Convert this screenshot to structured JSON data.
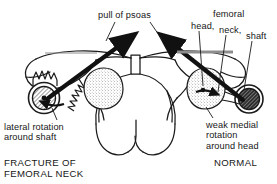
{
  "figure": {
    "background_color": "#ffffff",
    "ink_color": "#161616"
  },
  "annotations": {
    "psoas": "pull of psoas",
    "femoral": "femoral",
    "head": "head,",
    "neck": "neck,",
    "shaft": "shaft",
    "lateral_rotation": "lateral rotation\naround shaft",
    "weak_medial_rotation": "weak medial\nrotation\naround head"
  },
  "captions": {
    "left": "FRACTURE OF\nFEMORAL NECK",
    "right": "NORMAL"
  },
  "parts": {
    "left_shaft_section": "fractured-shaft-cross-section",
    "left_femoral_head": "displaced-femoral-head",
    "left_fracture_edge": "jagged-fracture-line",
    "right_femoral_head": "femoral-head",
    "right_shaft_section": "shaft-cross-section",
    "pelvis": "pelvis-outline",
    "psoas_arrow_left": "psoas-force-arrow-left",
    "psoas_arrow_right": "psoas-force-arrow-right",
    "rotation_arrow_right": "medial-rotation-arrow"
  }
}
